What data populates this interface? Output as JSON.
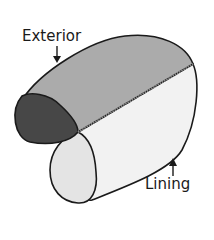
{
  "diagram": {
    "labels": {
      "exterior": "Exterior",
      "lining": "Lining"
    },
    "colors": {
      "exterior_fill": "#a9a9a9",
      "exterior_end": "#4a4a4a",
      "lining_fill": "#f0f0f0",
      "lining_end": "#e2e2e2",
      "outline": "#1a1a1a",
      "seam": "#8a8a8a"
    }
  }
}
